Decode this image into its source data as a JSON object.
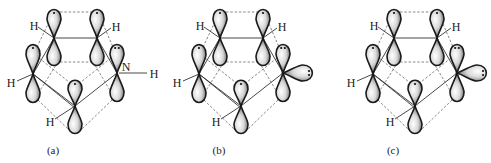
{
  "figure": {
    "panels": [
      {
        "id": "a",
        "label": "(a)",
        "heteroatom_label": "N",
        "heteroatom_substituent": "H",
        "hydrogen_labels": [
          "H",
          "H",
          "H",
          "H"
        ],
        "electron_dots_on_heteroatom_p": 2,
        "lone_pair_sp2_orbital": false
      },
      {
        "id": "b",
        "label": "(b)",
        "heteroatom_label": "",
        "heteroatom_substituent": "",
        "hydrogen_labels": [
          "H",
          "H",
          "H",
          "H"
        ],
        "electron_dots_on_heteroatom_p": 2,
        "lone_pair_sp2_orbital": true,
        "lone_pair_sp2_dots": 2
      },
      {
        "id": "c",
        "label": "(c)",
        "heteroatom_label": "",
        "heteroatom_substituent": "",
        "hydrogen_labels": [
          "H",
          "H",
          "H",
          "H"
        ],
        "electron_dots_on_heteroatom_p": 2,
        "lone_pair_sp2_orbital": true,
        "lone_pair_sp2_dots": 2
      }
    ],
    "colors": {
      "lobe_outline": "#1a1a1a",
      "lobe_fill_dark": "#5a5a5a",
      "lobe_fill_light": "#ffffff",
      "bond": "#333333",
      "dashed_overlap": "#555555"
    }
  }
}
